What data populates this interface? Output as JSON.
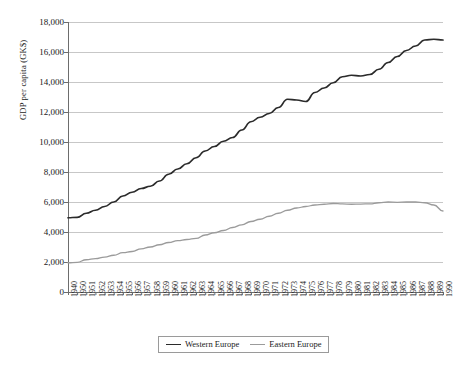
{
  "chart_data": {
    "type": "line",
    "title": "",
    "xlabel": "",
    "ylabel": "GDP per capita (GK$)",
    "ylim": [
      0,
      18000
    ],
    "y_ticks": [
      0,
      2000,
      4000,
      6000,
      8000,
      10000,
      12000,
      14000,
      16000,
      18000
    ],
    "y_tick_labels": [
      "0",
      "2,000",
      "4,000",
      "6,000",
      "8,000",
      "10,000",
      "12,000",
      "14,000",
      "16,000",
      "18,000"
    ],
    "grid": true,
    "legend_position": "bottom-center",
    "categories": [
      "1940",
      "1950",
      "1951",
      "1952",
      "1953",
      "1954",
      "1955",
      "1956",
      "1957",
      "1958",
      "1959",
      "1960",
      "1961",
      "1962",
      "1963",
      "1964",
      "1965",
      "1966",
      "1967",
      "1968",
      "1969",
      "1970",
      "1971",
      "1972",
      "1973",
      "1974",
      "1975",
      "1976",
      "1977",
      "1978",
      "1979",
      "1980",
      "1981",
      "1982",
      "1983",
      "1984",
      "1985",
      "1986",
      "1987",
      "1988",
      "1989",
      "1990"
    ],
    "series": [
      {
        "name": "Western Europe",
        "color": "#2b2b2b",
        "values": [
          4950,
          4980,
          5250,
          5450,
          5700,
          6000,
          6400,
          6650,
          6900,
          7050,
          7400,
          7850,
          8200,
          8550,
          8950,
          9400,
          9700,
          10050,
          10300,
          10800,
          11350,
          11650,
          11900,
          12300,
          12850,
          12800,
          12700,
          13300,
          13600,
          13950,
          14350,
          14450,
          14400,
          14500,
          14850,
          15300,
          15700,
          16100,
          16400,
          16800,
          16850,
          16800
        ]
      },
      {
        "name": "Eastern Europe",
        "color": "#9b9b9b",
        "values": [
          1950,
          1980,
          2150,
          2220,
          2330,
          2450,
          2620,
          2700,
          2880,
          3000,
          3150,
          3300,
          3420,
          3500,
          3570,
          3800,
          3950,
          4100,
          4300,
          4480,
          4700,
          4850,
          5050,
          5250,
          5450,
          5600,
          5700,
          5800,
          5850,
          5900,
          5870,
          5850,
          5860,
          5880,
          5950,
          6000,
          5980,
          6000,
          6000,
          5950,
          5800,
          5400
        ]
      }
    ]
  }
}
